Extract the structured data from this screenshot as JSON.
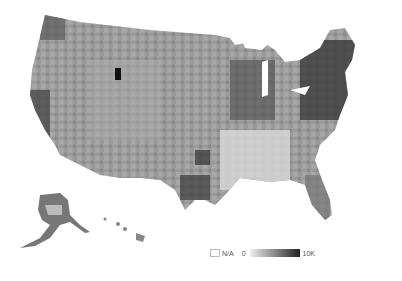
{
  "map": {
    "type": "choropleth",
    "region": "United States counties",
    "color_scheme": [
      "#ffffff",
      "#eeeeee",
      "#bbbbbb",
      "#888888",
      "#555555",
      "#222222"
    ]
  },
  "legend": {
    "na_label": "N/A",
    "min_label": "0",
    "max_label": "10K"
  }
}
